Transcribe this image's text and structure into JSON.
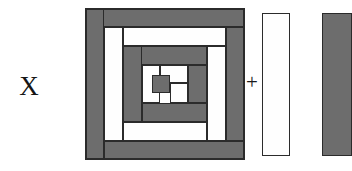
{
  "figure": {
    "multiplier_label": "X",
    "operator_label": "+",
    "colors": {
      "fabric_dark": "#6d6d6d",
      "fabric_light": "#fefefe",
      "outline": "#2b2b2b",
      "background": "#ffffff",
      "text": "#151515"
    }
  },
  "block": {
    "name": "log-cabin-block",
    "width": 158,
    "height": 150,
    "outline": "#2b2b2b",
    "pieces": [
      {
        "id": "r1-top",
        "shade": "dark",
        "x": 0,
        "y": 0,
        "w": 158,
        "h": 18
      },
      {
        "id": "r1-left",
        "shade": "dark",
        "x": 0,
        "y": 0,
        "w": 18,
        "h": 150
      },
      {
        "id": "r1-bottom",
        "shade": "dark",
        "x": 18,
        "y": 132,
        "w": 140,
        "h": 18
      },
      {
        "id": "r1-right",
        "shade": "dark",
        "x": 140,
        "y": 18,
        "w": 18,
        "h": 114
      },
      {
        "id": "r2-left",
        "shade": "light",
        "x": 18,
        "y": 18,
        "w": 19,
        "h": 114
      },
      {
        "id": "r2-top",
        "shade": "light",
        "x": 37,
        "y": 18,
        "w": 103,
        "h": 19
      },
      {
        "id": "r2-right",
        "shade": "light",
        "x": 121,
        "y": 37,
        "w": 19,
        "h": 95
      },
      {
        "id": "r2-bottom",
        "shade": "light",
        "x": 37,
        "y": 113,
        "w": 84,
        "h": 19
      },
      {
        "id": "r3-top",
        "shade": "dark",
        "x": 37,
        "y": 37,
        "w": 84,
        "h": 19
      },
      {
        "id": "r3-left",
        "shade": "dark",
        "x": 37,
        "y": 37,
        "w": 19,
        "h": 76
      },
      {
        "id": "r3-bottom",
        "shade": "dark",
        "x": 56,
        "y": 94,
        "w": 65,
        "h": 19
      },
      {
        "id": "r3-right",
        "shade": "dark",
        "x": 102,
        "y": 56,
        "w": 19,
        "h": 38
      },
      {
        "id": "r4-left",
        "shade": "light",
        "x": 56,
        "y": 56,
        "w": 18,
        "h": 38
      },
      {
        "id": "r4-top",
        "shade": "light",
        "x": 74,
        "y": 56,
        "w": 28,
        "h": 18
      },
      {
        "id": "r4-right",
        "shade": "light",
        "x": 84,
        "y": 74,
        "w": 18,
        "h": 20
      },
      {
        "id": "center",
        "shade": "dark",
        "x": 66,
        "y": 66,
        "w": 18,
        "h": 18
      }
    ]
  },
  "strips": [
    {
      "id": "white-strip",
      "label": "light-fabric-strip",
      "shade": "light"
    },
    {
      "id": "gray-strip",
      "label": "dark-fabric-strip",
      "shade": "dark"
    }
  ]
}
